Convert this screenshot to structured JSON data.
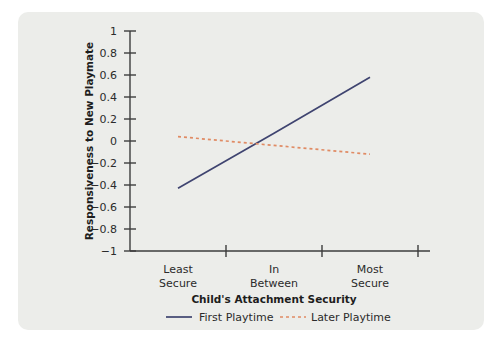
{
  "chart_data": {
    "type": "line",
    "title": "",
    "xlabel": "Child's Attachment Security",
    "ylabel": "Responsiveness to New Playmate",
    "x": [
      "Least Secure",
      "In Between",
      "Most Secure"
    ],
    "xtick_labels": [
      {
        "line1": "Least",
        "line2": "Secure"
      },
      {
        "line1": "In",
        "line2": "Between"
      },
      {
        "line1": "Most",
        "line2": "Secure"
      }
    ],
    "ylim": [
      -1,
      1
    ],
    "ytick_labels": [
      "1",
      "0.8",
      "0.6",
      "0.4",
      "0.2",
      "0",
      "−0.2",
      "−0.4",
      "−0.6",
      "−0.8",
      "−1"
    ],
    "ytick_values": [
      1,
      0.8,
      0.6,
      0.4,
      0.2,
      0,
      -0.2,
      -0.4,
      -0.6,
      -0.8,
      -1
    ],
    "grid": false,
    "legend_position": "bottom",
    "series": [
      {
        "name": "First Playtime",
        "style": "solid",
        "color": "#3f4470",
        "values": [
          -0.43,
          0.07,
          0.58
        ]
      },
      {
        "name": "Later Playtime",
        "style": "dashed",
        "color": "#e08b64",
        "values": [
          0.04,
          -0.04,
          -0.12
        ]
      }
    ]
  },
  "legend": {
    "items": [
      {
        "label": "First Playtime"
      },
      {
        "label": "Later Playtime"
      }
    ]
  },
  "panel": {
    "background_color": "#ecedea"
  }
}
